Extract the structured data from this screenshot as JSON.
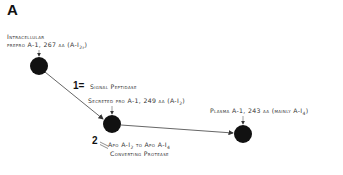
{
  "panel": {
    "label": "A"
  },
  "nodes": [
    {
      "id": "intracellular",
      "label_line1": "Intracellular",
      "label_line2_pre": "prepro A-1, 267 aa (A-I",
      "label_line2_sub": "2p",
      "label_line2_post": ")",
      "cx": 39,
      "cy": 66
    },
    {
      "id": "secreted",
      "label_pre": "Secreted pro A-1, 249 aa (A-I",
      "label_sub": "2",
      "label_post": ")",
      "cx": 112,
      "cy": 124
    },
    {
      "id": "plasma",
      "label_pre": "Plasma A-1, 243 aa (mainly A-I",
      "label_sub": "4",
      "label_post": ")",
      "cx": 243,
      "cy": 134
    }
  ],
  "steps": [
    {
      "number": "1",
      "symbol": "=",
      "text": "Signal Peptidase"
    },
    {
      "number": "2",
      "symbol": "=",
      "line1_pre": "Apo A-I",
      "line1_sub1": "2",
      "line1_mid": " to Apo A-I",
      "line1_sub2": "4",
      "line2": "Converting Protease"
    }
  ],
  "colors": {
    "node": "#111111",
    "line": "#555555",
    "text": "#333333"
  }
}
